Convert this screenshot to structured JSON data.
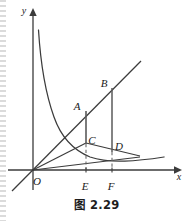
{
  "figure": {
    "caption": "图 2.29",
    "axes": {
      "x_label": "x",
      "y_label": "y",
      "origin_label": "O"
    },
    "points": [
      {
        "id": "A",
        "label": "A",
        "x": 86,
        "y": 111
      },
      {
        "id": "B",
        "label": "B",
        "x": 112,
        "y": 88
      },
      {
        "id": "C",
        "label": "C",
        "x": 86,
        "y": 143
      },
      {
        "id": "D",
        "label": "D",
        "x": 112,
        "y": 151
      },
      {
        "id": "E",
        "label": "E",
        "x": 86,
        "y": 170
      },
      {
        "id": "F",
        "label": "F",
        "x": 112,
        "y": 170
      }
    ],
    "label_positions": {
      "y": {
        "x": 24,
        "y": 13
      },
      "x": {
        "x": 179,
        "y": 179
      },
      "O": {
        "x": 36,
        "y": 184
      },
      "A": {
        "x": 76,
        "y": 108
      },
      "B": {
        "x": 103,
        "y": 85
      },
      "C": {
        "x": 88,
        "y": 143
      },
      "D": {
        "x": 116,
        "y": 148
      },
      "E": {
        "x": 82,
        "y": 188
      },
      "F": {
        "x": 108,
        "y": 188
      }
    },
    "curves": {
      "hyperbola_label": "hyperbola-curve",
      "line_OB_label": "line-through-origin-OB",
      "segment_AE_label": "segment-A-E",
      "segment_BF_label": "segment-B-F",
      "ray_OC_label": "ray-O-through-C",
      "ray_OD_label": "ray-O-through-D",
      "dashed_CE_label": "dashed-C-E",
      "dashed_DF_label": "dashed-D-F"
    },
    "colors": {
      "stroke": "#3b3b3b",
      "axis": "#3b3b3b",
      "text": "#1a1a1a",
      "background": "#ffffff"
    }
  }
}
